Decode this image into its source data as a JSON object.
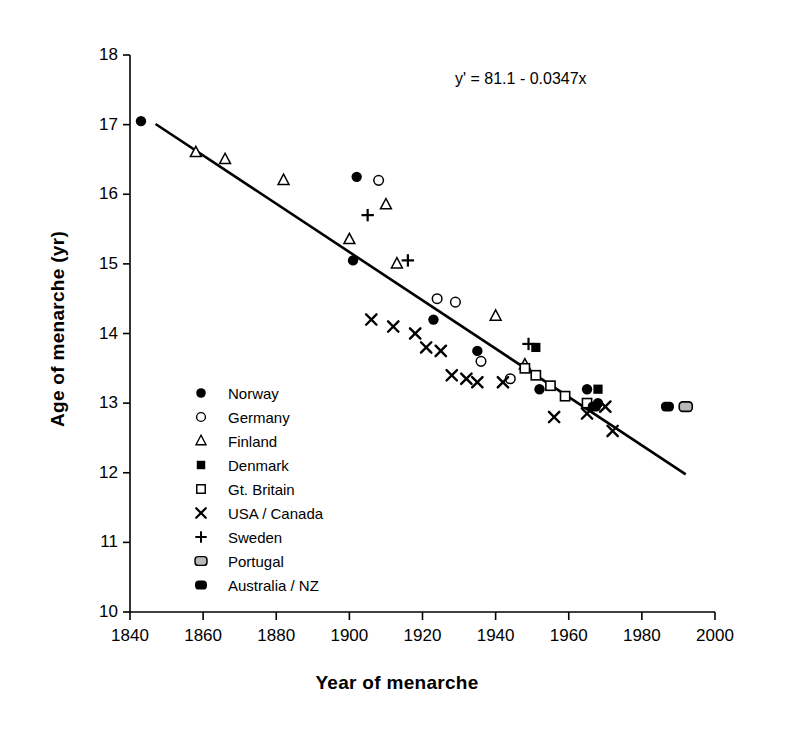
{
  "chart_data": {
    "type": "scatter",
    "title": "",
    "xlabel": "Year of menarche",
    "ylabel": "Age of menarche (yr)",
    "xlim": [
      1840,
      2000
    ],
    "ylim": [
      10,
      18
    ],
    "xticks": [
      1840,
      1860,
      1880,
      1900,
      1920,
      1940,
      1960,
      1980,
      2000
    ],
    "xtick_labels": [
      "1840",
      "1860",
      "1880",
      "1900",
      "1920",
      "1940",
      "1960",
      "1980",
      "2000"
    ],
    "yticks": [
      10,
      11,
      12,
      13,
      14,
      15,
      16,
      17,
      18
    ],
    "ytick_labels": [
      "10",
      "11",
      "12",
      "13",
      "14",
      "15",
      "16",
      "17",
      "18"
    ],
    "grid": false,
    "legend_position": "inside-lower-left",
    "annotation": "y' = 81.1 - 0.0347x",
    "trendline": {
      "label": "y' = 81.1 - 0.0347x",
      "intercept": 81.1,
      "slope": -0.0347,
      "x_start": 1847,
      "x_end": 1992
    },
    "series": [
      {
        "name": "Norway",
        "marker": "filled-circle",
        "color": "#000000",
        "points": [
          [
            1843,
            17.05
          ],
          [
            1902,
            16.25
          ],
          [
            1901,
            15.05
          ],
          [
            1923,
            14.2
          ],
          [
            1935,
            13.75
          ],
          [
            1952,
            13.2
          ],
          [
            1965,
            13.2
          ],
          [
            1968,
            13.0
          ]
        ]
      },
      {
        "name": "Germany",
        "marker": "open-circle",
        "color": "#000000",
        "points": [
          [
            1908,
            16.2
          ],
          [
            1924,
            14.5
          ],
          [
            1929,
            14.45
          ],
          [
            1936,
            13.6
          ],
          [
            1944,
            13.35
          ]
        ]
      },
      {
        "name": "Finland",
        "marker": "open-triangle",
        "color": "#000000",
        "points": [
          [
            1858,
            16.6
          ],
          [
            1866,
            16.5
          ],
          [
            1882,
            16.2
          ],
          [
            1910,
            15.85
          ],
          [
            1900,
            15.35
          ],
          [
            1913,
            15.0
          ],
          [
            1940,
            14.25
          ],
          [
            1948,
            13.55
          ]
        ]
      },
      {
        "name": "Denmark",
        "marker": "filled-square",
        "color": "#000000",
        "points": [
          [
            1951,
            13.8
          ],
          [
            1968,
            13.2
          ]
        ]
      },
      {
        "name": "Gt. Britain",
        "marker": "open-square",
        "color": "#000000",
        "points": [
          [
            1948,
            13.5
          ],
          [
            1951,
            13.4
          ],
          [
            1955,
            13.25
          ],
          [
            1959,
            13.1
          ],
          [
            1965,
            13.0
          ]
        ]
      },
      {
        "name": "USA / Canada",
        "marker": "cross-x",
        "color": "#000000",
        "points": [
          [
            1906,
            14.2
          ],
          [
            1912,
            14.1
          ],
          [
            1918,
            14.0
          ],
          [
            1921,
            13.8
          ],
          [
            1925,
            13.75
          ],
          [
            1928,
            13.4
          ],
          [
            1932,
            13.35
          ],
          [
            1935,
            13.3
          ],
          [
            1942,
            13.3
          ],
          [
            1956,
            12.8
          ],
          [
            1965,
            12.85
          ],
          [
            1970,
            12.95
          ],
          [
            1972,
            12.6
          ]
        ]
      },
      {
        "name": "Sweden",
        "marker": "plus",
        "color": "#000000",
        "points": [
          [
            1905,
            15.7
          ],
          [
            1916,
            15.05
          ],
          [
            1949,
            13.85
          ]
        ]
      },
      {
        "name": "Portugal",
        "marker": "grey-rounded-rect",
        "color": "#9a9a9a",
        "points": [
          [
            1992,
            12.95
          ]
        ]
      },
      {
        "name": "Australia / NZ",
        "marker": "filled-rounded-rect",
        "color": "#000000",
        "points": [
          [
            1967,
            12.95
          ],
          [
            1987,
            12.95
          ]
        ]
      }
    ]
  },
  "legend": {
    "items": [
      {
        "label": "Norway",
        "marker": "filled-circle"
      },
      {
        "label": "Germany",
        "marker": "open-circle"
      },
      {
        "label": "Finland",
        "marker": "open-triangle"
      },
      {
        "label": "Denmark",
        "marker": "filled-square"
      },
      {
        "label": "Gt. Britain",
        "marker": "open-square"
      },
      {
        "label": "USA / Canada",
        "marker": "cross-x"
      },
      {
        "label": "Sweden",
        "marker": "plus"
      },
      {
        "label": "Portugal",
        "marker": "grey-rounded-rect"
      },
      {
        "label": "Australia / NZ",
        "marker": "filled-rounded-rect"
      }
    ]
  }
}
